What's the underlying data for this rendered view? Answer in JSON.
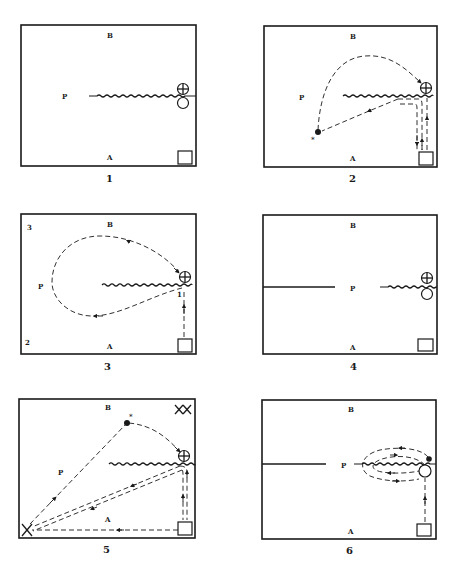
{
  "figure": {
    "panels": [
      {
        "id": "1",
        "caption": "1",
        "labels": {
          "top": "B",
          "bottom": "A",
          "left": "P"
        }
      },
      {
        "id": "2",
        "caption": "2",
        "labels": {
          "top": "B",
          "bottom": "A",
          "left": "P",
          "mark": "*"
        }
      },
      {
        "id": "3",
        "caption": "3",
        "labels": {
          "top": "B",
          "bottom": "A",
          "left": "P",
          "corner_top_left": "3",
          "corner_bottom_left": "2",
          "path_marker": "1"
        }
      },
      {
        "id": "4",
        "caption": "4",
        "labels": {
          "top": "B",
          "bottom": "A",
          "center": "P"
        }
      },
      {
        "id": "5",
        "caption": "5",
        "labels": {
          "top": "B",
          "bottom": "A",
          "left": "P",
          "mark": "*",
          "corner_top_right": "XX",
          "corner_bottom_left": "X"
        }
      },
      {
        "id": "6",
        "caption": "6",
        "labels": {
          "top": "B",
          "bottom": "A",
          "center": "P"
        }
      }
    ],
    "symbols": {
      "start_box": "square",
      "crossed_circle": "⊕",
      "open_circle": "○",
      "filled_dot": "●"
    }
  }
}
